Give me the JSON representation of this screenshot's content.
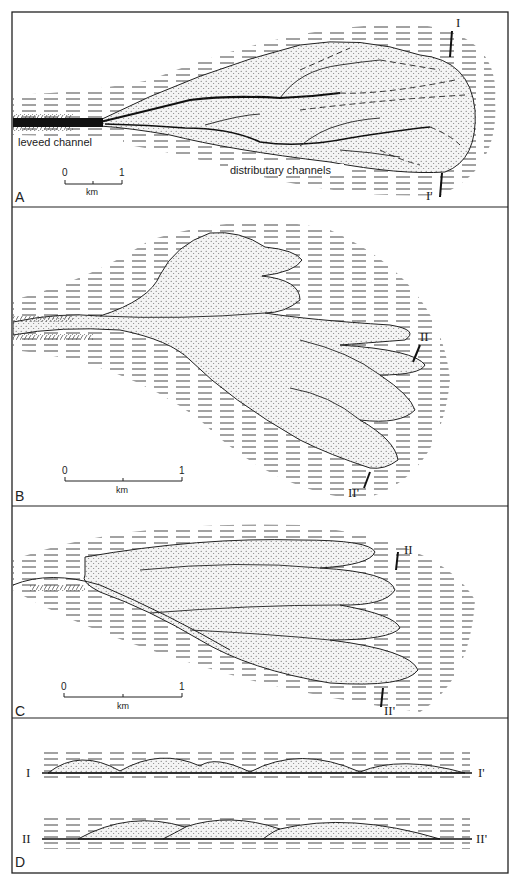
{
  "figure": {
    "panels": [
      {
        "id": "A",
        "label": "A",
        "annotations": {
          "levee": "leveed channel",
          "distributary": "distributary channels"
        },
        "scale": {
          "start": "0",
          "end": "1",
          "unit": "km"
        },
        "section": {
          "top": "I",
          "bottom": "I'"
        }
      },
      {
        "id": "B",
        "label": "B",
        "scale": {
          "start": "0",
          "end": "1",
          "unit": "km"
        },
        "section": {
          "top": "II",
          "bottom": "II'"
        }
      },
      {
        "id": "C",
        "label": "C",
        "scale": {
          "start": "0",
          "end": "1",
          "unit": "km"
        },
        "section": {
          "top": "II",
          "bottom": "II'"
        }
      },
      {
        "id": "D",
        "label": "D",
        "profiles": [
          {
            "left": "I",
            "right": "I'"
          },
          {
            "left": "II",
            "right": "II'"
          }
        ]
      }
    ]
  }
}
